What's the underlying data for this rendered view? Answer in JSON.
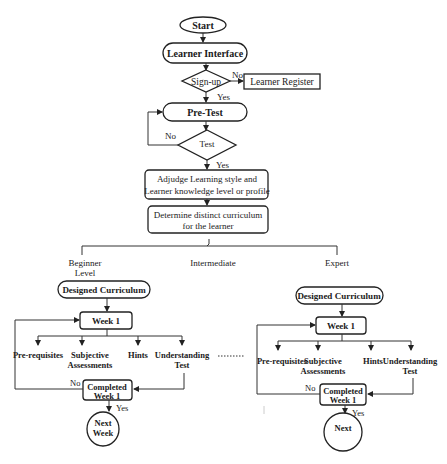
{
  "diagram": {
    "nodes": {
      "start": "Start",
      "learner_interface": "Learner Interface",
      "signup": "Sign-up",
      "learner_register": "Learner Register",
      "pretest": "Pre-Test",
      "test": "Test",
      "adjudge_line1": "Adjudge Learning style and",
      "adjudge_line2": "Learner knowledge level or profile",
      "determine_line1": "Determine distinct curriculum",
      "determine_line2": "for the learner"
    },
    "edge_labels": {
      "signup_no": "No",
      "signup_yes": "Yes",
      "test_no": "No",
      "test_yes": "Yes"
    },
    "levels": {
      "beginner_line1": "Beginner",
      "beginner_line2": "Level",
      "intermediate": "Intermediate",
      "expert": "Expert"
    },
    "beginner_branch": {
      "curriculum": "Designed Curriculum",
      "week": "Week 1",
      "items": [
        "Pre-requisites",
        "Subjective",
        "Assessments",
        "Hints",
        "Understanding",
        "Test"
      ],
      "completed_line1": "Completed",
      "completed_line2": "Week 1",
      "no": "No",
      "yes": "Yes",
      "next_line1": "Next",
      "next_line2": "Week"
    },
    "expert_branch": {
      "curriculum": "Designed Curriculum",
      "week": "Week 1",
      "items": [
        "Pre-requisites",
        "Subjective",
        "Assessments",
        "Hints",
        "Understanding",
        "Test"
      ],
      "completed_line1": "Completed",
      "completed_line2": "Week 1",
      "no": "No",
      "yes": "Yes",
      "next": "Next"
    }
  }
}
